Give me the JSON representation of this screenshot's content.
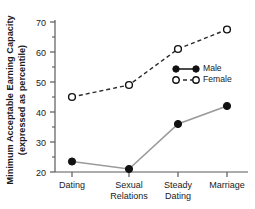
{
  "chart_data": {
    "type": "line",
    "title": "",
    "xlabel": "",
    "ylabel": "Minimum Acceptable Earning Capacity (expressed as percentile)",
    "ylabel_line1": "Minimum Acceptable Earning Capacity",
    "ylabel_line2": "(expressed as percentile)",
    "categories": [
      "Dating",
      "Sexual Relations",
      "Steady Dating",
      "Marriage"
    ],
    "category_lines": [
      [
        "Dating"
      ],
      [
        "Sexual",
        "Relations"
      ],
      [
        "Steady",
        "Dating"
      ],
      [
        "Marriage"
      ]
    ],
    "series": [
      {
        "name": "Male",
        "values": [
          23.5,
          21,
          36,
          42
        ],
        "marker": "filled-circle",
        "line_style": "solid",
        "color": "#111111",
        "line_color": "#9a9a9a"
      },
      {
        "name": "Female",
        "values": [
          45,
          49,
          61,
          67.5
        ],
        "marker": "open-circle",
        "line_style": "dashed",
        "color": "#111111",
        "line_color": "#2a2a2a"
      }
    ],
    "ylim": [
      20,
      70
    ],
    "y_major_ticks": [
      20,
      30,
      40,
      50,
      60,
      70
    ],
    "y_major_tick_labels": [
      "20",
      "30",
      "40",
      "50",
      "60",
      "70"
    ],
    "y_minor_ticks": [
      25,
      35,
      45,
      55,
      65
    ],
    "grid": false,
    "legend_position": "inside-right",
    "legend_entries": [
      "Male",
      "Female"
    ]
  }
}
